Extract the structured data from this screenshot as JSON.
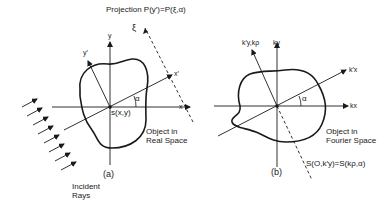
{
  "figure": {
    "panel_a": {
      "caption": "(a)",
      "projection_label": "Projection P(y′)=P(ξ,α)",
      "xi_label": "ξ",
      "axis_x": "x",
      "axis_y": "y",
      "axis_x_rot": "x′",
      "axis_y_rot": "y′",
      "angle": "α",
      "object_fn": "s(x,y)",
      "object_label": "Object in\nReal Space",
      "rays_label": "Incident\nRays"
    },
    "panel_b": {
      "caption": "(b)",
      "axis_x": "kx",
      "axis_y": "ky",
      "axis_x_rot": "k′x",
      "axis_y_rot": "k′y,kρ",
      "angle": "α",
      "object_label": "Object in\nFourier Space",
      "slice_label": "S(O,k′y)=S(kρ,α)"
    },
    "colors": {
      "ink": "#1a1a1a",
      "background": "#ffffff"
    }
  }
}
